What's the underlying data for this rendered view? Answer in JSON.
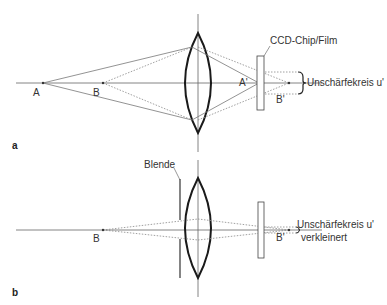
{
  "figure": {
    "panels": [
      {
        "id": "a",
        "panel_label": "a",
        "points": {
          "object_far": "A",
          "object_near": "B",
          "image_far": "A'",
          "image_near": "B'"
        },
        "sensor_label": "CCD-Chip/Film",
        "blur_label": "Unschärfekreis u'",
        "blur_label_line2": ""
      },
      {
        "id": "b",
        "panel_label": "b",
        "points": {
          "object_near": "B",
          "image_near": "B'"
        },
        "aperture_label": "Blende",
        "blur_label": "Unschärfekreis u'",
        "blur_label_line2": "verkleinert"
      }
    ],
    "colors": {
      "lens": "#1a1a1a",
      "axis": "#555555",
      "ray": "#666666",
      "text": "#333333"
    }
  }
}
